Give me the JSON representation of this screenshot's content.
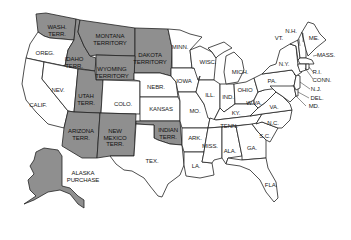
{
  "map": {
    "title": "",
    "colors": {
      "territory_fill": "#8f8f8f",
      "state_fill": "#ffffff",
      "border": "#222222"
    },
    "territories": [
      {
        "id": "wash",
        "label": "WASH.\nTERR.",
        "x": 57,
        "y": 30
      },
      {
        "id": "montana",
        "label": "MONTANA\nTERRITORY",
        "x": 110,
        "y": 39
      },
      {
        "id": "dakota",
        "label": "DAKOTA\nTERRITORY",
        "x": 150,
        "y": 58
      },
      {
        "id": "idaho",
        "label": "IDAHO\nTERR.",
        "x": 74,
        "y": 62
      },
      {
        "id": "wyoming",
        "label": "WYOMING\nTERRITORY",
        "x": 112,
        "y": 72
      },
      {
        "id": "utah",
        "label": "UTAH\nTERR.",
        "x": 86,
        "y": 99
      },
      {
        "id": "arizona",
        "label": "ARIZONA\nTERR.",
        "x": 81,
        "y": 134
      },
      {
        "id": "newmexico",
        "label": "NEW\nMEXICO\nTERR.",
        "x": 115,
        "y": 138
      },
      {
        "id": "indian",
        "label": "INDIAN\nTERR.",
        "x": 168,
        "y": 133
      },
      {
        "id": "alaska",
        "label": "ALASKA\nPURCHASE",
        "x": 83,
        "y": 176
      }
    ],
    "states": [
      {
        "id": "oreg",
        "label": "OREG.",
        "x": 45,
        "y": 53
      },
      {
        "id": "nev",
        "label": "NEV.",
        "x": 58,
        "y": 90
      },
      {
        "id": "calif",
        "label": "CALIF.",
        "x": 38,
        "y": 105
      },
      {
        "id": "colo",
        "label": "COLO.",
        "x": 123,
        "y": 104
      },
      {
        "id": "nebr",
        "label": "NEBR.",
        "x": 156,
        "y": 87
      },
      {
        "id": "kansas",
        "label": "KANSAS",
        "x": 161,
        "y": 109
      },
      {
        "id": "minn",
        "label": "MINN.",
        "x": 180,
        "y": 47
      },
      {
        "id": "iowa",
        "label": "IOWA",
        "x": 184,
        "y": 81
      },
      {
        "id": "wisc",
        "label": "WISC.",
        "x": 208,
        "y": 62
      },
      {
        "id": "mich",
        "label": "MICH.",
        "x": 240,
        "y": 72
      },
      {
        "id": "ill",
        "label": "ILL.",
        "x": 210,
        "y": 95
      },
      {
        "id": "ind",
        "label": "IND.",
        "x": 228,
        "y": 97
      },
      {
        "id": "ohio",
        "label": "OHIO",
        "x": 245,
        "y": 90
      },
      {
        "id": "pa",
        "label": "PA.",
        "x": 272,
        "y": 81
      },
      {
        "id": "ny",
        "label": "N.Y.",
        "x": 284,
        "y": 64
      },
      {
        "id": "vt",
        "label": "VT.",
        "x": 279,
        "y": 38
      },
      {
        "id": "nh",
        "label": "N.H.",
        "x": 291,
        "y": 31
      },
      {
        "id": "me",
        "label": "ME.",
        "x": 314,
        "y": 38
      },
      {
        "id": "mass",
        "label": "MASS.",
        "x": 326,
        "y": 55
      },
      {
        "id": "ri",
        "label": "R.I.",
        "x": 317,
        "y": 72
      },
      {
        "id": "conn",
        "label": "CONN.",
        "x": 322,
        "y": 80
      },
      {
        "id": "nj",
        "label": "N.J.",
        "x": 316,
        "y": 89
      },
      {
        "id": "del",
        "label": "DEL.",
        "x": 317,
        "y": 98
      },
      {
        "id": "md",
        "label": "MD.",
        "x": 314,
        "y": 106
      },
      {
        "id": "wva",
        "label": "W.VA.",
        "x": 254,
        "y": 103
      },
      {
        "id": "va",
        "label": "VA.",
        "x": 274,
        "y": 107
      },
      {
        "id": "ky",
        "label": "KY.",
        "x": 236,
        "y": 113
      },
      {
        "id": "mo",
        "label": "MO.",
        "x": 195,
        "y": 111
      },
      {
        "id": "tenn",
        "label": "TENN.",
        "x": 229,
        "y": 126
      },
      {
        "id": "nc",
        "label": "N.C.",
        "x": 273,
        "y": 123
      },
      {
        "id": "sc",
        "label": "S.C.",
        "x": 265,
        "y": 136
      },
      {
        "id": "ark",
        "label": "ARK.",
        "x": 195,
        "y": 138
      },
      {
        "id": "miss",
        "label": "MISS.",
        "x": 210,
        "y": 146
      },
      {
        "id": "ala",
        "label": "ALA.",
        "x": 230,
        "y": 151
      },
      {
        "id": "ga",
        "label": "GA.",
        "x": 252,
        "y": 148
      },
      {
        "id": "la",
        "label": "LA.",
        "x": 196,
        "y": 166
      },
      {
        "id": "tex",
        "label": "TEX.",
        "x": 152,
        "y": 161
      },
      {
        "id": "fla",
        "label": "FLA.",
        "x": 271,
        "y": 185
      }
    ]
  }
}
